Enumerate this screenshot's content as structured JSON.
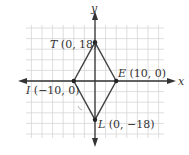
{
  "figure": {
    "type": "coordinate-plane-quadrilateral",
    "axes": {
      "x_label": "x",
      "y_label": "y"
    },
    "colors": {
      "grid": "#d6d6d6",
      "axis": "#333333",
      "shape": "#444444",
      "text": "#333333"
    },
    "points": [
      {
        "id": "T",
        "letter": "T",
        "coords": " (0, 18)",
        "x": 0,
        "y": 18
      },
      {
        "id": "E",
        "letter": "E",
        "coords": " (10, 0)",
        "x": 10,
        "y": 0
      },
      {
        "id": "L",
        "letter": "L",
        "coords": " (0, −18)",
        "x": 0,
        "y": -18
      },
      {
        "id": "I",
        "letter": "I",
        "coords": " (−10, 0)",
        "x": -10,
        "y": 0
      }
    ],
    "polygon_order": [
      "T",
      "E",
      "L",
      "I"
    ]
  }
}
